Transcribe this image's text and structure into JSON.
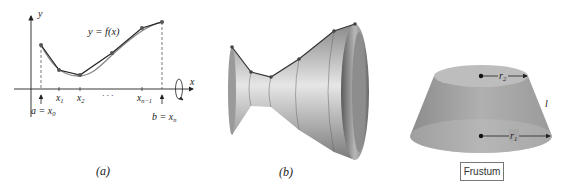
{
  "panels": [
    {
      "id": "a",
      "caption": "(a)",
      "curve_label": "y = f(x)",
      "axis_labels": {
        "x": "x",
        "y": "y"
      },
      "tick_labels": [
        "x1",
        "x2",
        "· · ·",
        "xn−1"
      ],
      "endpoint_labels": {
        "a": "a = x0",
        "b": "b = xn"
      },
      "polyline_points": [
        [
          41,
          45
        ],
        [
          59,
          70
        ],
        [
          80,
          75
        ],
        [
          112,
          53
        ],
        [
          142,
          28
        ],
        [
          162,
          22
        ]
      ]
    },
    {
      "id": "b",
      "caption": "(b)",
      "description": "Surface of revolution approximated by frustums"
    },
    {
      "id": "frustum",
      "caption": "Frustum",
      "labels": {
        "top_radius": "r",
        "top_sub": "2",
        "bottom_radius": "r",
        "bottom_sub": "1",
        "slant": "l"
      }
    }
  ],
  "text": {
    "a_caption": "(a)",
    "b_caption": "(b)",
    "frustum_caption": "Frustum"
  }
}
